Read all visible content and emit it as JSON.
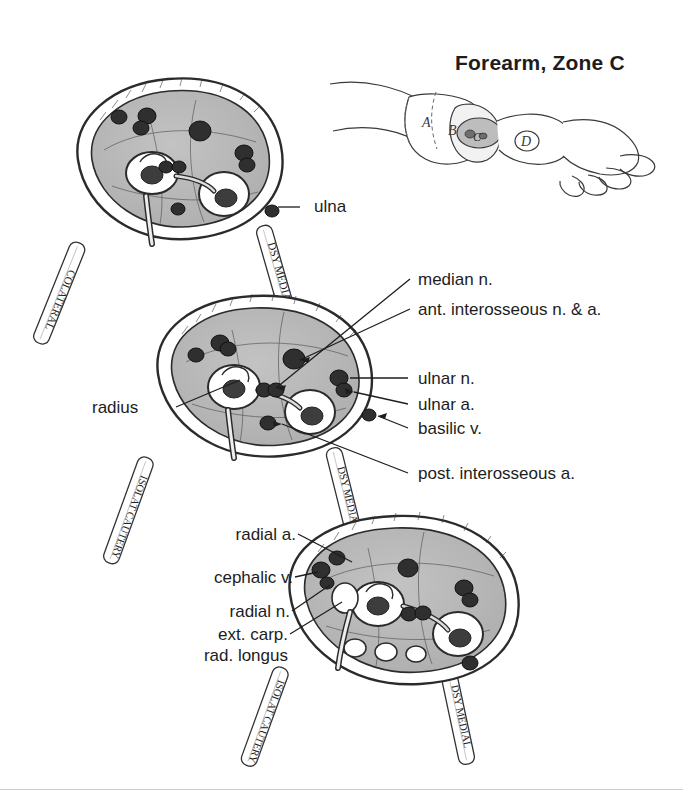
{
  "page": {
    "title": "Forearm, Zone C",
    "background": "#ffffff",
    "ink": "#1d1d1d",
    "fill_muscle": "#b8b8b8",
    "fill_light": "#e8e8e8"
  },
  "inset": {
    "name": "forearm-arm-inset",
    "zones": [
      "A",
      "B",
      "C",
      "D"
    ],
    "highlighted_zone": "C"
  },
  "sections": [
    {
      "id": "proximal",
      "name": "cross-section-proximal"
    },
    {
      "id": "middle",
      "name": "cross-section-middle"
    },
    {
      "id": "distal",
      "name": "cross-section-distal"
    }
  ],
  "bands": [
    {
      "id": "band-top-left",
      "text": "COLATERAL"
    },
    {
      "id": "band-top-right",
      "text": "DSY MEDIAL"
    },
    {
      "id": "band-mid-left",
      "text": "ISOLAT CAUTERY"
    },
    {
      "id": "band-mid-right",
      "text": "DSY MEDIAL"
    },
    {
      "id": "band-bottom-left",
      "text": "ISOLAT CAUTERY"
    },
    {
      "id": "band-bottom-right",
      "text": "DSY MEDIAL"
    }
  ],
  "labels": {
    "ulna": "ulna",
    "median_n": "median n.",
    "ant_interosseous": "ant. interosseous n. & a.",
    "ulnar_n": "ulnar n.",
    "ulnar_a": "ulnar a.",
    "basilic_v": "basilic v.",
    "post_interosseous_a": "post. interosseous a.",
    "radius": "radius",
    "radial_a": "radial a.",
    "cephalic_v": "cephalic v.",
    "radial_n": "radial n.",
    "ext_carp_1": "ext. carp.",
    "ext_carp_2": "rad. longus"
  }
}
